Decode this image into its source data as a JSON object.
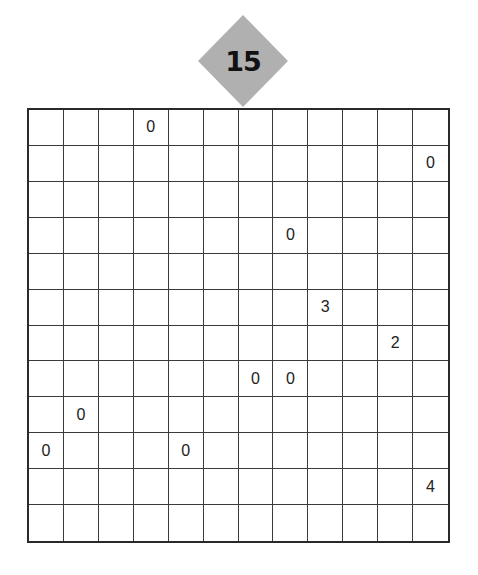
{
  "puzzle": {
    "number": "15",
    "badge_color": "#b0b0b0",
    "rows": 12,
    "cols": 12,
    "clues": [
      {
        "row": 0,
        "col": 3,
        "value": "0"
      },
      {
        "row": 1,
        "col": 11,
        "value": "0"
      },
      {
        "row": 3,
        "col": 7,
        "value": "0"
      },
      {
        "row": 5,
        "col": 8,
        "value": "3"
      },
      {
        "row": 6,
        "col": 10,
        "value": "2"
      },
      {
        "row": 7,
        "col": 6,
        "value": "0"
      },
      {
        "row": 7,
        "col": 7,
        "value": "0"
      },
      {
        "row": 8,
        "col": 1,
        "value": "0"
      },
      {
        "row": 9,
        "col": 0,
        "value": "0"
      },
      {
        "row": 9,
        "col": 4,
        "value": "0"
      },
      {
        "row": 10,
        "col": 11,
        "value": "4"
      }
    ]
  }
}
